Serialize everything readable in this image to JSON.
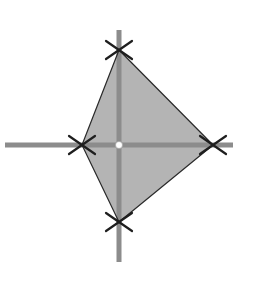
{
  "diagram": {
    "type": "polygon-on-axes",
    "width": 254,
    "height": 292,
    "colors": {
      "background": "#ffffff",
      "axis": "#8c8c8c",
      "fill": "#b4b4b4",
      "outline": "#2a2a2a",
      "marker": "#1e1e1e",
      "origin_dot": "#ffffff"
    },
    "axes": {
      "horizontal": {
        "x1": 5,
        "x2": 233,
        "y": 145,
        "width": 5
      },
      "vertical": {
        "x": 119,
        "y1": 30,
        "y2": 262,
        "width": 5
      }
    },
    "origin": {
      "x": 119,
      "y": 145,
      "r": 3.5
    },
    "vertices": [
      {
        "name": "top",
        "x": 119,
        "y": 50
      },
      {
        "name": "right",
        "x": 213,
        "y": 145
      },
      {
        "name": "bottom",
        "x": 119,
        "y": 222
      },
      {
        "name": "left",
        "x": 82,
        "y": 145
      }
    ],
    "marker": {
      "shape": "x",
      "half_w": 13,
      "half_h": 9,
      "stroke": 2.2
    }
  }
}
